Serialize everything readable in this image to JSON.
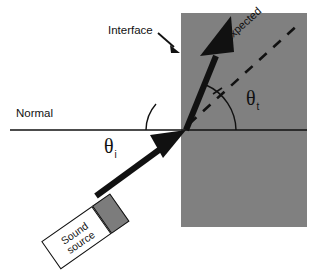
{
  "figure": {
    "background_color": "#ffffff",
    "medium_block_color": "#808080",
    "line_color": "#111111",
    "transducer_head_color": "#7c7c7c"
  },
  "labels": {
    "normal": "Normal",
    "interface": "Interface",
    "expected": "Expected",
    "theta_incident_symbol": "θ",
    "theta_incident_subscript": "i",
    "theta_transmitted_symbol": "θ",
    "theta_transmitted_subscript": "t",
    "source_line1": "Sound",
    "source_line2": "source"
  },
  "geometry": {
    "medium_block": {
      "x": 181,
      "y": 13,
      "width": 126,
      "height": 214
    },
    "normal_line": {
      "x1": 10,
      "y1": 130,
      "x2": 307,
      "y2": 130
    },
    "incidence_point": {
      "x": 186,
      "y": 130
    },
    "incident_ray": {
      "from_x": 96,
      "from_y": 196,
      "to_x": 186,
      "to_y": 130
    },
    "transmitted_ray": {
      "from_x": 186,
      "from_y": 130,
      "to_x": 230,
      "to_y": 20
    },
    "expected_dashed_ray": {
      "from_x": 189,
      "from_y": 124,
      "to_x": 301,
      "to_y": 22
    },
    "interface_pointer": {
      "from_x": 160,
      "from_y": 35,
      "to_x": 179,
      "to_y": 52
    }
  }
}
